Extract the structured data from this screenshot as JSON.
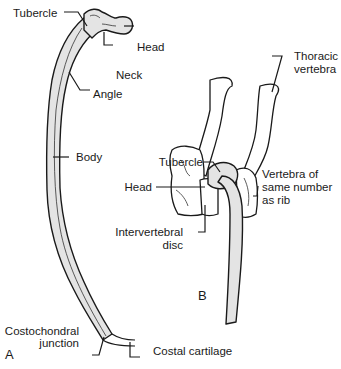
{
  "figure": {
    "panel_a": {
      "letter": "A",
      "labels": {
        "tubercle": "Tubercle",
        "head": "Head",
        "neck": "Neck",
        "angle": "Angle",
        "body": "Body",
        "costochondral_1": "Costochondral",
        "costochondral_2": "junction",
        "costal_cartilage": "Costal cartilage"
      }
    },
    "panel_b": {
      "letter": "B",
      "labels": {
        "thoracic_1": "Thoracic",
        "thoracic_2": "vertebra",
        "tubercle": "Tubercle",
        "head": "Head",
        "vertebra_1": "Vertebra of",
        "vertebra_2": "same number",
        "vertebra_3": "as rib",
        "disc_1": "Intervertebral",
        "disc_2": "disc"
      }
    },
    "colors": {
      "bone_fill": "#e4e4e4",
      "outline": "#1a1a1a",
      "background": "#ffffff"
    }
  }
}
